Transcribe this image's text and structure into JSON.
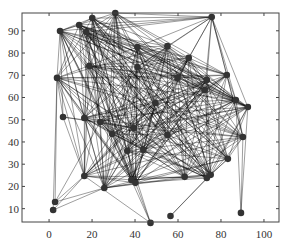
{
  "chart_data": {
    "type": "scatter",
    "subtype": "network-graph",
    "title": "",
    "xlabel": "",
    "ylabel": "",
    "xlim": [
      -12.6,
      107
    ],
    "ylim": [
      4,
      98
    ],
    "grid": false,
    "legend": null,
    "x_ticks": [
      0,
      20,
      40,
      60,
      80,
      100
    ],
    "y_ticks": [
      10,
      20,
      30,
      40,
      50,
      60,
      70,
      80,
      90
    ],
    "nodes": [
      {
        "id": 1,
        "x": 30.8,
        "y": 98.0
      },
      {
        "id": 2,
        "x": 20.1,
        "y": 95.7
      },
      {
        "id": 3,
        "x": 75.7,
        "y": 96.2
      },
      {
        "id": 4,
        "x": 14.0,
        "y": 92.6
      },
      {
        "id": 5,
        "x": 17.3,
        "y": 89.4
      },
      {
        "id": 6,
        "x": 5.1,
        "y": 89.9
      },
      {
        "id": 7,
        "x": 55.1,
        "y": 83.1
      },
      {
        "id": 8,
        "x": 65.0,
        "y": 77.8
      },
      {
        "id": 9,
        "x": 41.1,
        "y": 82.7
      },
      {
        "id": 10,
        "x": 18.7,
        "y": 74.2
      },
      {
        "id": 11,
        "x": 3.7,
        "y": 68.8
      },
      {
        "id": 12,
        "x": 41.1,
        "y": 73.7
      },
      {
        "id": 13,
        "x": 82.7,
        "y": 70.1
      },
      {
        "id": 14,
        "x": 73.4,
        "y": 67.9
      },
      {
        "id": 15,
        "x": 59.8,
        "y": 68.8
      },
      {
        "id": 16,
        "x": 49.5,
        "y": 57.5
      },
      {
        "id": 17,
        "x": 72.4,
        "y": 63.4
      },
      {
        "id": 18,
        "x": 86.9,
        "y": 58.9
      },
      {
        "id": 19,
        "x": 92.5,
        "y": 55.7
      },
      {
        "id": 20,
        "x": 6.5,
        "y": 51.2
      },
      {
        "id": 21,
        "x": 16.4,
        "y": 50.8
      },
      {
        "id": 22,
        "x": 23.8,
        "y": 49.0
      },
      {
        "id": 23,
        "x": 39.3,
        "y": 46.3
      },
      {
        "id": 24,
        "x": 55.1,
        "y": 43.1
      },
      {
        "id": 25,
        "x": 90.2,
        "y": 42.2
      },
      {
        "id": 26,
        "x": 29.4,
        "y": 43.6
      },
      {
        "id": 27,
        "x": 36.4,
        "y": 36.0
      },
      {
        "id": 28,
        "x": 43.9,
        "y": 36.4
      },
      {
        "id": 29,
        "x": 83.2,
        "y": 32.4
      },
      {
        "id": 30,
        "x": 38.3,
        "y": 22.9
      },
      {
        "id": 31,
        "x": 40.2,
        "y": 21.6
      },
      {
        "id": 32,
        "x": 63.1,
        "y": 24.3
      },
      {
        "id": 33,
        "x": 73.4,
        "y": 23.8
      },
      {
        "id": 34,
        "x": 75.2,
        "y": 25.2
      },
      {
        "id": 35,
        "x": 16.4,
        "y": 24.7
      },
      {
        "id": 36,
        "x": 25.7,
        "y": 19.3
      },
      {
        "id": 37,
        "x": 2.8,
        "y": 13.0
      },
      {
        "id": 38,
        "x": 1.9,
        "y": 9.4
      },
      {
        "id": 39,
        "x": 47.2,
        "y": 3.6
      },
      {
        "id": 40,
        "x": 56.5,
        "y": 6.7
      },
      {
        "id": 41,
        "x": 89.3,
        "y": 8.1
      }
    ],
    "dense_core_nodes": [
      1,
      2,
      4,
      5,
      6,
      7,
      8,
      9,
      10,
      11,
      12,
      13,
      14,
      15,
      16,
      17,
      18,
      19,
      21,
      22,
      23,
      24,
      25,
      26,
      27,
      28,
      29,
      30,
      31,
      32,
      33,
      34,
      35,
      36
    ],
    "extra_edges": [
      [
        3,
        1
      ],
      [
        3,
        2
      ],
      [
        3,
        4
      ],
      [
        3,
        5
      ],
      [
        3,
        6
      ],
      [
        3,
        7
      ],
      [
        3,
        8
      ],
      [
        3,
        9
      ],
      [
        3,
        12
      ],
      [
        3,
        13
      ],
      [
        3,
        14
      ],
      [
        3,
        15
      ],
      [
        3,
        17
      ],
      [
        3,
        18
      ],
      [
        3,
        19
      ],
      [
        3,
        25
      ],
      [
        20,
        11
      ],
      [
        20,
        6
      ],
      [
        20,
        22
      ],
      [
        20,
        23
      ],
      [
        20,
        35
      ],
      [
        37,
        11
      ],
      [
        37,
        22
      ],
      [
        37,
        35
      ],
      [
        37,
        36
      ],
      [
        38,
        11
      ],
      [
        38,
        35
      ],
      [
        38,
        36
      ],
      [
        39,
        35
      ],
      [
        39,
        30
      ],
      [
        39,
        31
      ],
      [
        39,
        27
      ],
      [
        40,
        33
      ],
      [
        40,
        34
      ],
      [
        41,
        19
      ],
      [
        41,
        18
      ],
      [
        41,
        25
      ]
    ]
  },
  "style": {
    "node_color": "#333333",
    "edge_color": "#000000",
    "axis_color": "#444444",
    "background": "#ffffff"
  }
}
